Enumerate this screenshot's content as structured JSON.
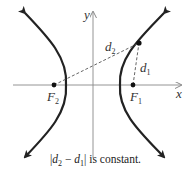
{
  "diagram": {
    "axes": {
      "x_label": "x",
      "y_label": "y"
    },
    "foci": [
      {
        "name": "F",
        "sub": "1",
        "cx": 133,
        "cy": 85
      },
      {
        "name": "F",
        "sub": "2",
        "cx": 54,
        "cy": 85
      }
    ],
    "distances": [
      {
        "name": "d",
        "sub": "1"
      },
      {
        "name": "d",
        "sub": "2"
      }
    ],
    "caption": {
      "abs_open": "|",
      "d2": "d",
      "d2_sub": "2",
      "minus": " − ",
      "d1": "d",
      "d1_sub": "1",
      "abs_close": "|",
      "rest": " is constant."
    },
    "colors": {
      "curve": "#222222",
      "axis": "#888888",
      "dash": "#555555"
    }
  }
}
